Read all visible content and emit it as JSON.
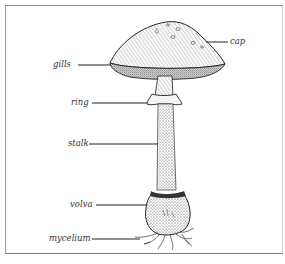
{
  "figure": {
    "labels": [
      {
        "id": "cap",
        "text": "cap"
      },
      {
        "id": "gills",
        "text": "gills"
      },
      {
        "id": "ring",
        "text": "ring"
      },
      {
        "id": "stalk",
        "text": "stalk"
      },
      {
        "id": "volva",
        "text": "volva"
      },
      {
        "id": "mycelium",
        "text": "mycelium"
      }
    ]
  },
  "colors": {
    "ink": "#2a2a2a",
    "frame": "#8a8a8a",
    "background": "#ffffff"
  }
}
